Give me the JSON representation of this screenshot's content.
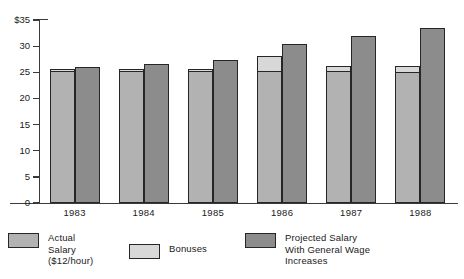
{
  "chart_data": {
    "type": "bar",
    "title": "",
    "subtitle": "",
    "xlabel": "",
    "ylabel": "",
    "categories": [
      "1983",
      "1984",
      "1985",
      "1986",
      "1987",
      "1988"
    ],
    "ylim": [
      0,
      35
    ],
    "yticks": [
      0,
      5,
      10,
      15,
      20,
      25,
      30,
      35
    ],
    "ytick_labels": [
      "0",
      "5",
      "10",
      "15",
      "20",
      "25",
      "30",
      "$35"
    ],
    "grid": false,
    "legend_position": "bottom",
    "stacked_pairs": true,
    "series": [
      {
        "name": "Actual Salary ($12/hour)",
        "color": "#b2b2b2",
        "values": [
          25.3,
          25.3,
          25.2,
          25.2,
          25.3,
          25.1
        ]
      },
      {
        "name": "Bonuses",
        "color": "#d8d8d8",
        "stacked_on": "Actual Salary ($12/hour)",
        "values": [
          0.4,
          0.4,
          0.5,
          2.9,
          1.0,
          1.1
        ]
      },
      {
        "name": "Projected Salary With General Wage Increases",
        "color": "#8c8c8c",
        "values": [
          26.0,
          26.5,
          27.4,
          30.5,
          32.0,
          33.5
        ]
      }
    ],
    "annotations": []
  },
  "axis": {
    "y_tick_labels": [
      "$35",
      "30",
      "25",
      "20",
      "15",
      "10",
      "5",
      "0"
    ],
    "x_tick_labels": [
      "1983",
      "1984",
      "1985",
      "1986",
      "1987",
      "1988"
    ]
  },
  "legend": {
    "items": [
      {
        "label": "Actual\nSalary\n($12/hour)",
        "color": "#b2b2b2"
      },
      {
        "label": "Bonuses",
        "color": "#d8d8d8"
      },
      {
        "label": "Projected Salary\nWith General Wage\nIncreases",
        "color": "#8c8c8c"
      }
    ]
  }
}
